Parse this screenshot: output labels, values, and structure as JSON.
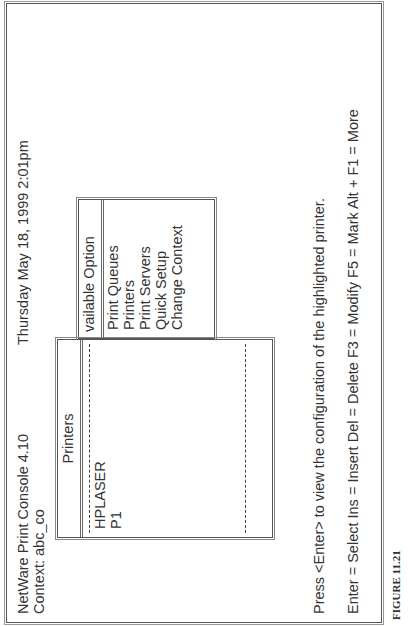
{
  "header": {
    "app_title": "NetWare Print Console  4.10",
    "datetime": "Thursday   May   18, 1999  2:01pm",
    "context": "Context:  abc_co"
  },
  "available_options": {
    "title": "vailable Option",
    "items": [
      {
        "label": "Print Queues"
      },
      {
        "label": "Printers"
      },
      {
        "label": "Print Servers"
      },
      {
        "label": "Quick Setup"
      },
      {
        "label": "Change Context"
      }
    ]
  },
  "printers_list": {
    "title": "Printers",
    "items": [
      {
        "label": "HPLASER"
      },
      {
        "label": "P1"
      }
    ]
  },
  "footer": {
    "prompt": "Press  <Enter>  to view the configuration of the highlighted printer.",
    "keys": "Enter = Select   Ins = Insert   Del = Delete   F3 = Modify   F5 = Mark  Alt + F1 = More"
  },
  "caption": "FIGURE 11.21"
}
